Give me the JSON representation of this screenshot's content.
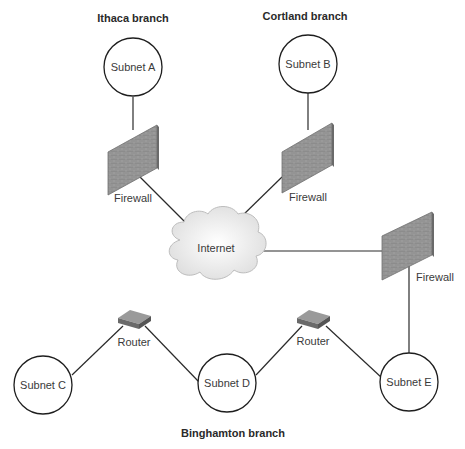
{
  "branches": {
    "ithaca": "Ithaca branch",
    "cortland": "Cortland branch",
    "binghamton": "Binghamton branch"
  },
  "subnets": {
    "a": "Subnet A",
    "b": "Subnet B",
    "c": "Subnet C",
    "d": "Subnet D",
    "e": "Subnet E"
  },
  "devices": {
    "firewall_label": "Firewall",
    "router_label": "Router",
    "internet_label": "Internet"
  },
  "colors": {
    "firewall": "#8a8a8a",
    "router": "#7a7a7a",
    "cloud": "#f4f4f4",
    "line": "#2a2a2a"
  }
}
